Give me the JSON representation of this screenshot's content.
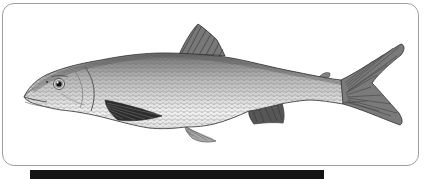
{
  "window": {
    "background": "#ffffff"
  },
  "card": {
    "background": "#ffffff",
    "border_color": "#9e9e9e",
    "corner_radius": "12px"
  },
  "figure": {
    "alt": "Black-and-white engraved illustration of a slender silvery whitefish-like fish facing left, with a dark triangular dorsal fin, dark pectoral fin, small adipose fin and a deeply forked tail",
    "palette": {
      "back": "#6e6e6e",
      "midbody": "#b8b8b8",
      "belly": "#efefef",
      "fin_dark": "#2d2d2d",
      "fin_mid": "#7a7a7a",
      "outline": "#2f2f2f"
    }
  },
  "caption_bar": {
    "background": "#141414"
  }
}
